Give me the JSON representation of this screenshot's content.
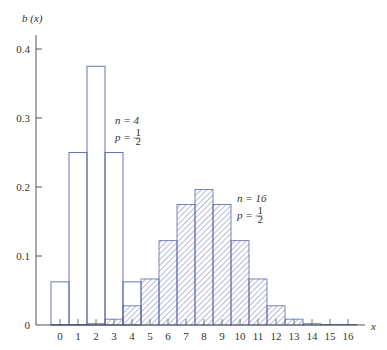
{
  "chart_data": {
    "type": "bar",
    "title": "",
    "xlabel": "x",
    "ylabel": "b (x)",
    "ylim": [
      0,
      0.4
    ],
    "yticks": [
      {
        "value": 0,
        "label": "0"
      },
      {
        "value": 0.1,
        "label": "0.1"
      },
      {
        "value": 0.2,
        "label": "0.2"
      },
      {
        "value": 0.3,
        "label": "0.3"
      },
      {
        "value": 0.4,
        "label": "0.4"
      }
    ],
    "categories": [
      0,
      1,
      2,
      3,
      4,
      5,
      6,
      7,
      8,
      9,
      10,
      11,
      12,
      13,
      14,
      15,
      16
    ],
    "xtick_labels": [
      "0",
      "1",
      "2",
      "3",
      "4",
      "5",
      "6",
      "7",
      "8",
      "9",
      "10",
      "11",
      "12",
      "13",
      "14",
      "15",
      "16"
    ],
    "grid": false,
    "series": [
      {
        "name": "n = 4, p = 1/2",
        "style": "outline",
        "x": [
          0,
          1,
          2,
          3,
          4
        ],
        "values": [
          0.0625,
          0.25,
          0.375,
          0.25,
          0.0625
        ]
      },
      {
        "name": "n = 16, p = 1/2",
        "style": "hatched",
        "x": [
          0,
          1,
          2,
          3,
          4,
          5,
          6,
          7,
          8,
          9,
          10,
          11,
          12,
          13,
          14,
          15,
          16
        ],
        "values": [
          2e-05,
          0.0002,
          0.0018,
          0.0085,
          0.0278,
          0.0667,
          0.1222,
          0.1746,
          0.1964,
          0.1746,
          0.1222,
          0.0667,
          0.0278,
          0.0085,
          0.0018,
          0.0002,
          2e-05
        ]
      }
    ],
    "annotations": [
      {
        "series": "n4",
        "line1": "n = 4",
        "line2_prefix": "p = ",
        "num": "1",
        "den": "2"
      },
      {
        "series": "n16",
        "line1": "n = 16",
        "line2_prefix": "p = ",
        "num": "1",
        "den": "2"
      }
    ],
    "colors": {
      "bars": "#5a66a8",
      "axis": "#555555",
      "text": "#333333"
    }
  }
}
